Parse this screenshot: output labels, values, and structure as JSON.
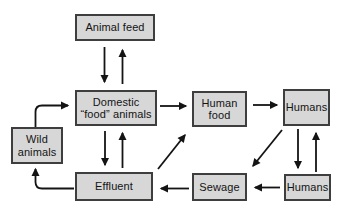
{
  "diagram": {
    "background": "#ffffff",
    "box_fill": "#d7d7d7",
    "box_border": "#3e3e3e",
    "arrow_color": "#141414",
    "nodes": [
      {
        "id": "animal-feed",
        "label": "Animal feed"
      },
      {
        "id": "domestic-food-animals",
        "label": "Domestic\n“food” animals"
      },
      {
        "id": "human-food",
        "label": "Human\nfood"
      },
      {
        "id": "humans-top",
        "label": "Humans"
      },
      {
        "id": "wild-animals",
        "label": "Wild\nanimals"
      },
      {
        "id": "effluent",
        "label": "Effluent"
      },
      {
        "id": "sewage",
        "label": "Sewage"
      },
      {
        "id": "humans-bottom",
        "label": "Humans"
      }
    ],
    "edges": [
      {
        "from": "animal-feed",
        "to": "domestic-food-animals"
      },
      {
        "from": "domestic-food-animals",
        "to": "animal-feed"
      },
      {
        "from": "domestic-food-animals",
        "to": "human-food"
      },
      {
        "from": "human-food",
        "to": "humans-top"
      },
      {
        "from": "domestic-food-animals",
        "to": "effluent"
      },
      {
        "from": "effluent",
        "to": "domestic-food-animals"
      },
      {
        "from": "wild-animals",
        "to": "domestic-food-animals"
      },
      {
        "from": "effluent",
        "to": "wild-animals"
      },
      {
        "from": "effluent",
        "to": "human-food"
      },
      {
        "from": "humans-top",
        "to": "sewage"
      },
      {
        "from": "humans-top",
        "to": "humans-bottom"
      },
      {
        "from": "humans-bottom",
        "to": "humans-top"
      },
      {
        "from": "humans-bottom",
        "to": "sewage"
      },
      {
        "from": "sewage",
        "to": "effluent"
      }
    ]
  }
}
